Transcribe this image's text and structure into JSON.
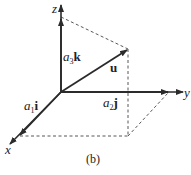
{
  "figure": {
    "caption": "(b)",
    "axes": {
      "x": "x",
      "y": "y",
      "z": "z"
    },
    "components": {
      "a1i": {
        "coef": "a",
        "sub": "1",
        "vec": "i"
      },
      "a2j": {
        "coef": "a",
        "sub": "2",
        "vec": "j"
      },
      "a3k": {
        "coef": "a",
        "sub": "3",
        "vec": "k"
      }
    },
    "vector_label": "u",
    "colors": {
      "axis": "#2b2b2b",
      "dash": "#444444",
      "text": "#222222"
    }
  }
}
